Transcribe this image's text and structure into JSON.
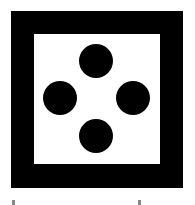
{
  "icon": {
    "name": "dice-four-icon",
    "frame_color": "#000000",
    "inner_color": "#ffffff",
    "dot_color": "#000000",
    "dots": [
      {
        "name": "dot-top",
        "cx": 96,
        "cy": 61
      },
      {
        "name": "dot-left",
        "cx": 60,
        "cy": 98
      },
      {
        "name": "dot-right",
        "cx": 133,
        "cy": 98
      },
      {
        "name": "dot-bottom",
        "cx": 96,
        "cy": 136
      }
    ]
  }
}
